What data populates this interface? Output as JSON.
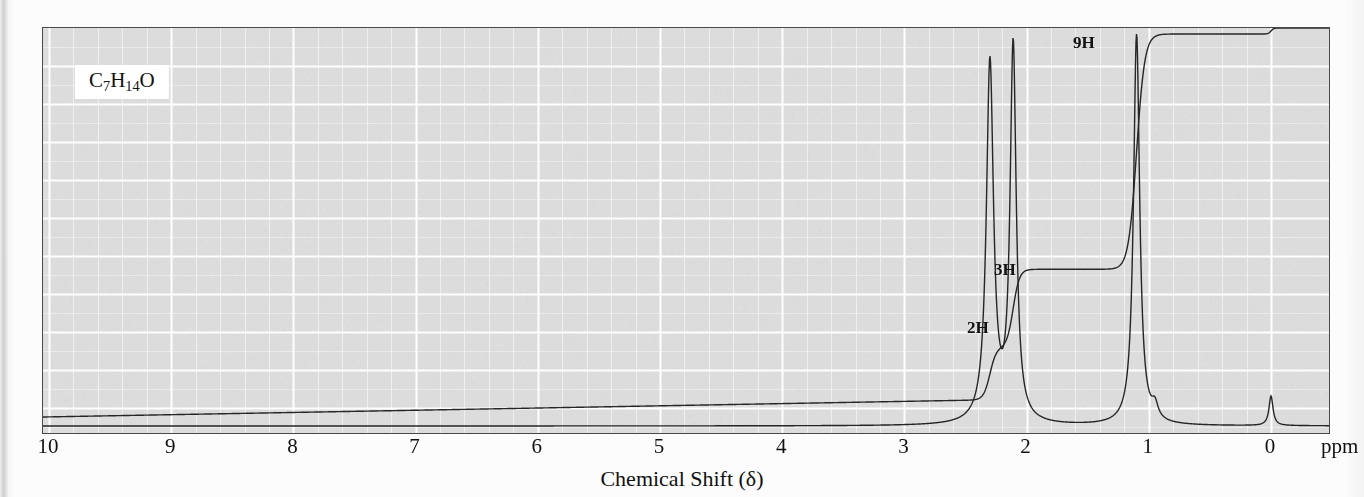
{
  "figure": {
    "type": "nmr-spectrum",
    "formula_html": "C<sub>7</sub>H<sub>14</sub>O",
    "formula_text": "C7H14O",
    "x_axis_title": "Chemical Shift (δ)",
    "x_unit_label": "ppm",
    "x_ticks": [
      "10",
      "9",
      "8",
      "7",
      "6",
      "5",
      "4",
      "3",
      "2",
      "1",
      "0"
    ],
    "background_color": "#dcdcdc",
    "grid_color": "#ffffff",
    "trace_color": "#262626",
    "frame_color": "#4a4a4a"
  },
  "integration_labels": [
    {
      "text": "9H",
      "ppm": 1.1,
      "x": 1072,
      "y": 33
    },
    {
      "text": "3H",
      "ppm": 2.1,
      "x": 993,
      "y": 260
    },
    {
      "text": "2H",
      "ppm": 2.3,
      "x": 966,
      "y": 318
    }
  ],
  "chart_data": {
    "type": "line",
    "title": "",
    "xlabel": "Chemical Shift (δ)",
    "ylabel": "",
    "xlim": [
      10,
      0
    ],
    "xlim_note": "axis reversed: 10 ppm at left, 0 ppm at right",
    "ylim": [
      0,
      1
    ],
    "grid": true,
    "legend": false,
    "series": [
      {
        "name": "spectrum",
        "description": "1H NMR absorption trace, baseline near bottom of frame",
        "peaks": [
          {
            "ppm": 2.3,
            "relative_height": 0.92,
            "width_ppm": 0.035,
            "assignment": "2H",
            "multiplicity": "singlet"
          },
          {
            "ppm": 2.11,
            "relative_height": 0.96,
            "width_ppm": 0.03,
            "assignment": "3H",
            "multiplicity": "singlet"
          },
          {
            "ppm": 1.1,
            "relative_height": 1.0,
            "width_ppm": 0.03,
            "assignment": "9H",
            "multiplicity": "singlet"
          },
          {
            "ppm": 0.0,
            "relative_height": 0.075,
            "width_ppm": 0.02,
            "assignment": "TMS",
            "multiplicity": "singlet"
          },
          {
            "ppm": 0.95,
            "relative_height": 0.035,
            "width_ppm": 0.03,
            "assignment": "",
            "multiplicity": "small shoulder"
          }
        ]
      },
      {
        "name": "integration",
        "description": "stepped integral curve rising right-to-left-of-peaks; plateau heights cumulative",
        "steps": [
          {
            "ppm": 2.3,
            "integral_H": 2,
            "label": "2H"
          },
          {
            "ppm": 2.11,
            "integral_H": 3,
            "label": "3H"
          },
          {
            "ppm": 1.1,
            "integral_H": 9,
            "label": "9H"
          },
          {
            "ppm": 0.0,
            "integral_H": 0,
            "label": ""
          }
        ]
      }
    ]
  }
}
